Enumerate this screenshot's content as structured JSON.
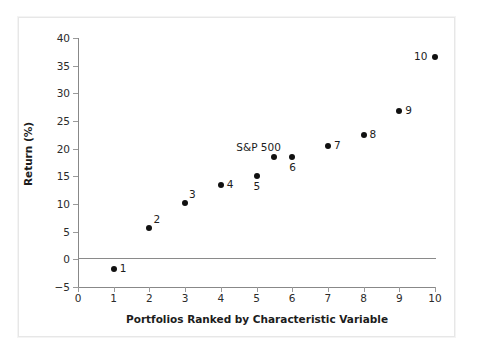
{
  "chart_data": {
    "type": "scatter",
    "title": "",
    "xlabel": "Portfolios Ranked by Characteristic Variable",
    "ylabel": "Return (%)",
    "xlim": [
      0,
      10
    ],
    "ylim": [
      -5,
      40
    ],
    "xticks": [
      "0",
      "1",
      "2",
      "3",
      "4",
      "5",
      "6",
      "7",
      "8",
      "9",
      "10"
    ],
    "xtick_values": [
      0,
      1,
      2,
      3,
      4,
      5,
      6,
      7,
      8,
      9,
      10
    ],
    "yticks": [
      "40",
      "35",
      "30",
      "25",
      "20",
      "15",
      "10",
      "5",
      "0",
      "−5"
    ],
    "ytick_values": [
      40,
      35,
      30,
      25,
      20,
      15,
      10,
      5,
      0,
      -5
    ],
    "grid": false,
    "legend": null,
    "zero_reference_line": 0,
    "points": [
      {
        "label": "1",
        "x": 1,
        "y": -1.8,
        "label_pos": "right"
      },
      {
        "label": "2",
        "x": 2,
        "y": 5.6,
        "label_pos": "upper-right"
      },
      {
        "label": "3",
        "x": 3,
        "y": 10.2,
        "label_pos": "upper-right"
      },
      {
        "label": "4",
        "x": 4,
        "y": 13.4,
        "label_pos": "right"
      },
      {
        "label": "5",
        "x": 5,
        "y": 15.0,
        "label_pos": "below"
      },
      {
        "label": "S&P 500",
        "x": 5.5,
        "y": 18.5,
        "label_pos": "above"
      },
      {
        "label": "6",
        "x": 6,
        "y": 18.5,
        "label_pos": "below"
      },
      {
        "label": "7",
        "x": 7,
        "y": 20.4,
        "label_pos": "right"
      },
      {
        "label": "8",
        "x": 8,
        "y": 22.4,
        "label_pos": "right"
      },
      {
        "label": "9",
        "x": 9,
        "y": 26.8,
        "label_pos": "right"
      },
      {
        "label": "10",
        "x": 10,
        "y": 36.5,
        "label_pos": "left"
      }
    ],
    "colors": {
      "marker": "#111111",
      "axis": "#888888",
      "text": "#1c1c1c",
      "background": "#ffffff",
      "frame": "#e7e7e7"
    }
  }
}
